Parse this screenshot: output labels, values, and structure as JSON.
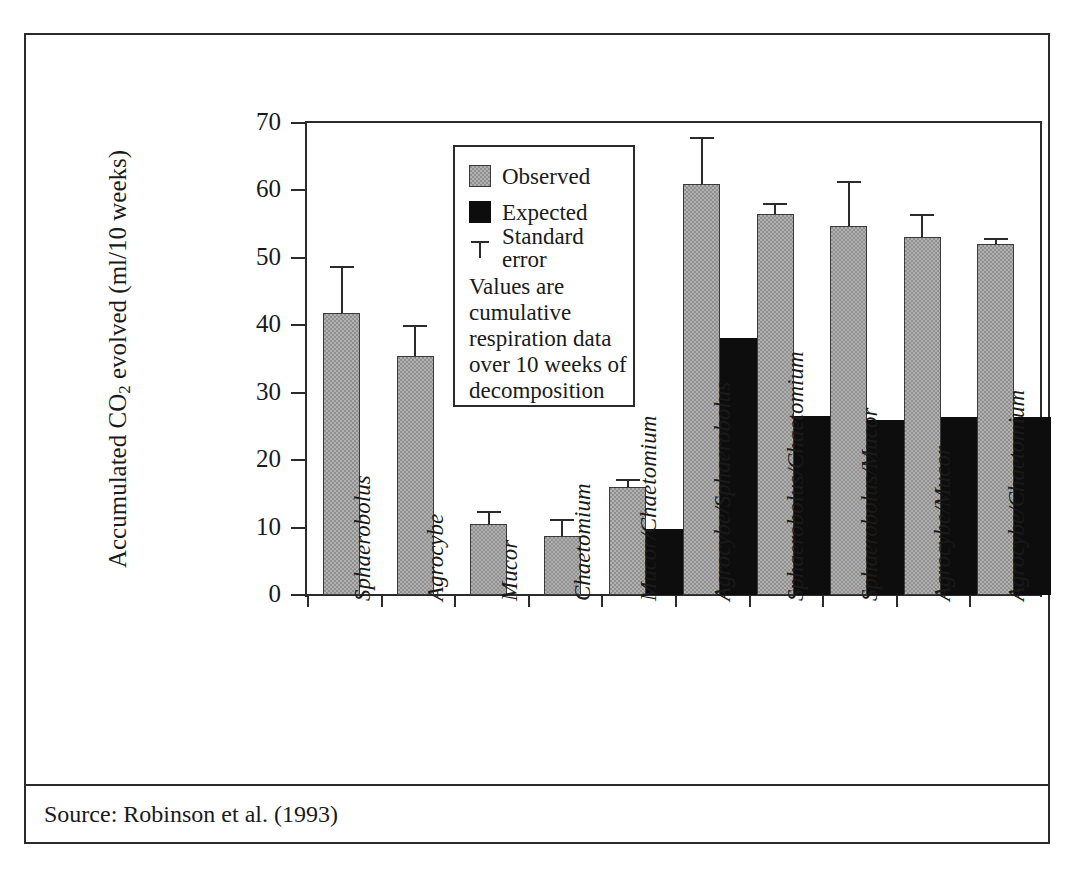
{
  "figure": {
    "caption_truncated": "",
    "source_text": "Source: Robinson et al. (1993)"
  },
  "legend": {
    "observed_label": "Observed",
    "expected_label": "Expected",
    "standard_error_label": "Standard error",
    "note": "Values are cumulative respiration data over 10 weeks of decomposition",
    "observed_color": "#8f8f8f",
    "expected_color": "#0d0d0d"
  },
  "chart_data": {
    "type": "bar",
    "title": "",
    "subtitle": "",
    "xlabel": "",
    "ylabel": "Accumulated CO2 evolved (ml/10 weeks)",
    "ylabel_prefix": "Accumulated CO",
    "ylabel_sub": "2",
    "ylabel_suffix": " evolved (ml/10 weeks)",
    "ylim": [
      0,
      70
    ],
    "yticks": [
      0,
      10,
      20,
      30,
      40,
      50,
      60,
      70
    ],
    "ytick_labels": [
      "0",
      "10",
      "20",
      "30",
      "40",
      "50",
      "60",
      "70"
    ],
    "grid": false,
    "legend_position": "inside-upper-left",
    "categories": [
      "Sphaerobolus",
      "Agrocybe",
      "Mucor",
      "Chaetomium",
      "Mucor/Chaetomium",
      "Agrocybe/Sphaerobolus",
      "Sphaerobolus/Chaetomium",
      "Sphaerobolus/Mucor",
      "Agrocybe/Mucor",
      "Agrocybe/Chaetomium"
    ],
    "series": [
      {
        "name": "Observed",
        "color": "#8f8f8f",
        "values": [
          41.8,
          35.5,
          10.5,
          8.8,
          16.0,
          61.0,
          56.5,
          54.8,
          53.1,
          52.0
        ],
        "errors": [
          6.7,
          4.3,
          1.7,
          2.2,
          0.9,
          6.7,
          1.4,
          6.3,
          3.1,
          0.6
        ]
      },
      {
        "name": "Expected",
        "color": "#0d0d0d",
        "values": [
          null,
          null,
          null,
          null,
          9.8,
          38.1,
          26.5,
          25.9,
          26.4,
          26.4
        ],
        "errors": [
          null,
          null,
          null,
          null,
          null,
          null,
          null,
          null,
          null,
          null
        ]
      }
    ]
  }
}
